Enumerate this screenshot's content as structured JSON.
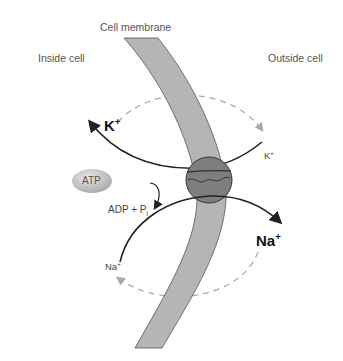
{
  "labels": {
    "membrane": "Cell membrane",
    "inside": "Inside cell",
    "outside": "Outside cell",
    "atp": "ATP",
    "adp": "ADP + P",
    "adp_sub": "i"
  },
  "ions": {
    "k_big": "K",
    "k_big_charge": "+",
    "k_small": "K",
    "k_small_charge": "+",
    "na_big": "Na",
    "na_big_charge": "+",
    "na_small": "Na",
    "na_small_charge": "+"
  },
  "colors": {
    "membrane": "#b5b5b5",
    "pump": "#7e7e7e",
    "atp": "#bdbdbd",
    "arrow": "#222222",
    "dashed": "#aaaaaa"
  }
}
